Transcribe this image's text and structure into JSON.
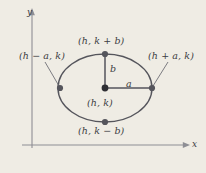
{
  "figure": {
    "background_color": "#efece4",
    "stroke_color": "#5a5a60",
    "text_color": "#3c3c42"
  },
  "axes": {
    "y_label": "y",
    "x_label": "x"
  },
  "labels": {
    "top_vertex": "(h, k + b)",
    "left_vertex": "(h − a, k)",
    "right_vertex": "(h + a, k)",
    "center": "(h, k)",
    "bottom_vertex": "(h, k − b)",
    "semi_minor_segment": "b",
    "semi_major_segment": "a"
  },
  "geometry": {
    "center_x": 105,
    "center_y": 88,
    "semi_major_a": 47,
    "semi_minor_b": 34
  }
}
